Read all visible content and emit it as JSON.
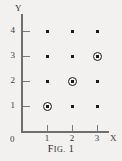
{
  "figure": {
    "caption_prefix": "F",
    "caption_small": "IG.",
    "caption_number": "1",
    "caption_full": "FIG. 1"
  },
  "axes": {
    "y_label": "Y",
    "x_label": "X",
    "origin_label": "0",
    "y_ticks": [
      "1",
      "2",
      "3",
      "4"
    ],
    "x_ticks": [
      "1",
      "2",
      "3"
    ],
    "axis_color": "#6e6e6e",
    "text_color": "#3a3a3a"
  },
  "chart_data": {
    "type": "scatter",
    "xlabel": "X",
    "ylabel": "Y",
    "xlim": [
      0,
      3.6
    ],
    "ylim": [
      0,
      4.6
    ],
    "grid": false,
    "legend": "none",
    "point_color": "#1a1a1a",
    "marker": "square-dot",
    "highlight_marker": "circled-dot",
    "points": [
      {
        "x": 1,
        "y": 1,
        "circled": true
      },
      {
        "x": 2,
        "y": 1,
        "circled": false
      },
      {
        "x": 3,
        "y": 1,
        "circled": false
      },
      {
        "x": 1,
        "y": 2,
        "circled": false
      },
      {
        "x": 2,
        "y": 2,
        "circled": true
      },
      {
        "x": 3,
        "y": 2,
        "circled": false
      },
      {
        "x": 1,
        "y": 3,
        "circled": false
      },
      {
        "x": 2,
        "y": 3,
        "circled": false
      },
      {
        "x": 3,
        "y": 3,
        "circled": true
      },
      {
        "x": 1,
        "y": 4,
        "circled": false
      },
      {
        "x": 2,
        "y": 4,
        "circled": false
      },
      {
        "x": 3,
        "y": 4,
        "circled": false
      }
    ],
    "circled_points": [
      [
        1,
        1
      ],
      [
        2,
        2
      ],
      [
        3,
        3
      ]
    ],
    "x_tick_values": [
      1,
      2,
      3
    ],
    "y_tick_values": [
      1,
      2,
      3,
      4
    ]
  }
}
